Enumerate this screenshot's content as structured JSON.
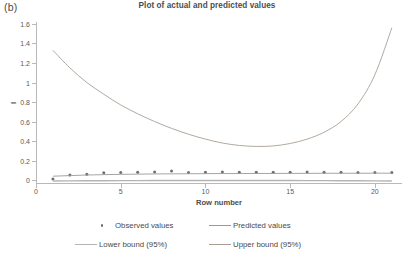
{
  "figure": {
    "panel_label": "(b)",
    "title": "Plot of actual and predicted values"
  },
  "axes": {
    "x_title": "Row number",
    "y_title": "I",
    "x_ticks": [
      "0",
      "5",
      "10",
      "15",
      "20"
    ],
    "y_ticks": [
      "0",
      "0.2",
      "0.4",
      "0.6",
      "0.8",
      "1",
      "1.2",
      "1.4",
      "1.6"
    ]
  },
  "legend": {
    "items": [
      {
        "label": "Observed values",
        "marker": "dot",
        "color": "#6e6e6e"
      },
      {
        "label": "Predicted values",
        "marker": "line",
        "color": "#9a9a9a"
      },
      {
        "label": "Lower bound (95%)",
        "marker": "line",
        "color": "#b4b4b4"
      },
      {
        "label": "Upper bound (95%)",
        "marker": "line",
        "color": "#a89f94"
      }
    ]
  },
  "colors": {
    "observed": "#6e6e6e",
    "predicted": "#9a9a9a",
    "lower_bound": "#b4b4b4",
    "upper_bound": "#a89f94",
    "axis": "#b9b9b9",
    "text": "#4a4a4a",
    "background": "#ffffff"
  },
  "chart_data": {
    "type": "line",
    "title": "Plot of actual and predicted values",
    "xlabel": "Row number",
    "ylabel": "I",
    "xlim": [
      0,
      21.6
    ],
    "ylim": [
      -0.04,
      1.62
    ],
    "grid": false,
    "legend_position": "bottom",
    "x": [
      1,
      2,
      3,
      4,
      5,
      6,
      7,
      8,
      9,
      10,
      11,
      12,
      13,
      14,
      15,
      16,
      17,
      18,
      19,
      20,
      21
    ],
    "series": [
      {
        "name": "Observed values",
        "type": "scatter",
        "values": [
          0.012,
          0.052,
          0.06,
          0.074,
          0.078,
          0.08,
          0.082,
          0.092,
          0.078,
          0.08,
          0.082,
          0.08,
          0.08,
          0.08,
          0.08,
          0.082,
          0.08,
          0.08,
          0.078,
          0.078,
          0.078
        ]
      },
      {
        "name": "Predicted values",
        "type": "line",
        "values": [
          0.04,
          0.046,
          0.052,
          0.056,
          0.059,
          0.061,
          0.063,
          0.064,
          0.065,
          0.066,
          0.067,
          0.067,
          0.068,
          0.068,
          0.069,
          0.069,
          0.07,
          0.07,
          0.07,
          0.071,
          0.071
        ]
      },
      {
        "name": "Lower bound (95%)",
        "type": "line",
        "values": [
          -0.01,
          -0.008,
          -0.007,
          -0.006,
          -0.005,
          -0.005,
          -0.004,
          -0.004,
          -0.004,
          -0.004,
          -0.004,
          -0.004,
          -0.004,
          -0.004,
          -0.004,
          -0.005,
          -0.005,
          -0.006,
          -0.007,
          -0.008,
          -0.01
        ]
      },
      {
        "name": "Upper bound (95%)",
        "type": "line",
        "values": [
          1.33,
          1.15,
          1.0,
          0.88,
          0.77,
          0.68,
          0.6,
          0.53,
          0.47,
          0.42,
          0.38,
          0.355,
          0.345,
          0.35,
          0.375,
          0.42,
          0.49,
          0.6,
          0.78,
          1.08,
          1.56
        ]
      }
    ]
  }
}
